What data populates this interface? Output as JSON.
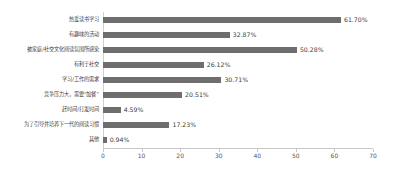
{
  "chart_data": {
    "type": "bar",
    "orientation": "horizontal",
    "title": "",
    "xlabel": "",
    "ylabel": "",
    "xlim": [
      0,
      70
    ],
    "xticks": [
      0,
      10,
      20,
      30,
      40,
      50,
      60,
      70
    ],
    "grid": false,
    "legend": null,
    "bar_color": "#6e6e6e",
    "background_color": "#ffffff",
    "value_suffix": "%",
    "categories": [
      "热爱读书学习",
      "有趣味的活动",
      "被家庭/社交文化阅读氛围所感染",
      "有利于社交",
      "学习/工作的需求",
      "竞争压力大，需要“加餐”",
      "赶时间/打发时间",
      "为了引导并培养下一代的阅读习惯",
      "其他"
    ],
    "values": [
      61.7,
      32.87,
      50.28,
      26.12,
      30.71,
      20.51,
      4.59,
      17.23,
      0.94
    ],
    "data_labels": [
      "61.70%",
      "32.87%",
      "50.28%",
      "26.12%",
      "30.71%",
      "20.51%",
      "4.59%",
      "17.23%",
      "0.94%"
    ]
  }
}
